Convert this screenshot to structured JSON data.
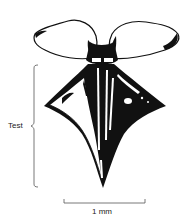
{
  "figure": {
    "annotations": {
      "test_label": "Test",
      "scale_label": "1 mm"
    },
    "colors": {
      "ink": "#111111",
      "paper": "#ffffff",
      "line": "#555555"
    }
  }
}
